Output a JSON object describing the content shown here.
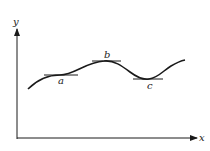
{
  "diagram": {
    "axes": {
      "x_label": "x",
      "y_label": "y"
    },
    "points": [
      {
        "id": "a",
        "label": "a",
        "kind": "horizontal tangent (inflection)"
      },
      {
        "id": "b",
        "label": "b",
        "kind": "local maximum with horizontal tangent"
      },
      {
        "id": "c",
        "label": "c",
        "kind": "local minimum with horizontal tangent"
      }
    ],
    "colors": {
      "stroke": "#1a1a1a",
      "background": "#ffffff"
    }
  }
}
